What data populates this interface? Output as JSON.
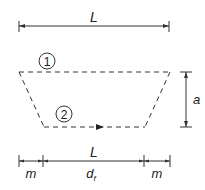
{
  "diagram": {
    "top_dimension": {
      "label": "L"
    },
    "path_one": {
      "label": "1"
    },
    "path_two": {
      "label": "2"
    },
    "height_dimension": {
      "label": "a"
    },
    "bottom_dimension": {
      "total_label": "L",
      "left_segment_label": "m",
      "middle_segment_label": "d",
      "middle_segment_subscript": "f",
      "right_segment_label": "m"
    },
    "colors": {
      "line": "#333333",
      "background": "#ffffff"
    }
  }
}
